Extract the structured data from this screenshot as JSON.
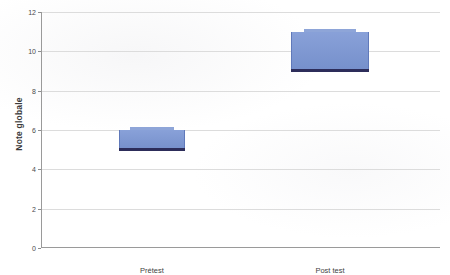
{
  "chart_data": {
    "type": "box",
    "title": "",
    "xlabel": "",
    "ylabel": "Note globale",
    "categories": [
      "Prétest",
      "Post test"
    ],
    "ylim": [
      0,
      12
    ],
    "yticks": [
      0,
      2,
      4,
      6,
      8,
      10,
      12
    ],
    "ytick_labels": [
      "0",
      "2",
      "4",
      "6",
      "8",
      "10",
      "12"
    ],
    "grid": true,
    "legend": "none",
    "boxes": [
      {
        "category": "Prétest",
        "box_bottom": 5.0,
        "box_top": 6.0,
        "median": 5.0,
        "cap_top": 6.05
      },
      {
        "category": "Post test",
        "box_bottom": 9.0,
        "box_top": 11.0,
        "median": 9.0,
        "cap_top": 11.05
      }
    ],
    "colors": {
      "box_fill": "#7b96d4",
      "box_edge": "#6079ba",
      "median_line": "#2d2d5a",
      "cap": "#8ea5d8",
      "gridline": "#dcdcdc",
      "axis": "#9a9a9a",
      "text": "#3a3a3a",
      "background": "#ffffff"
    }
  },
  "axis": {
    "y_title": "Note globale"
  },
  "ticks": [
    {
      "label": "12",
      "value": 12
    },
    {
      "label": "10",
      "value": 10
    },
    {
      "label": "8",
      "value": 8
    },
    {
      "label": "6",
      "value": 6
    },
    {
      "label": "4",
      "value": 4
    },
    {
      "label": "2",
      "value": 2
    },
    {
      "label": "0",
      "value": 0
    }
  ],
  "categories": [
    {
      "label": "Prétest"
    },
    {
      "label": "Post test"
    }
  ]
}
